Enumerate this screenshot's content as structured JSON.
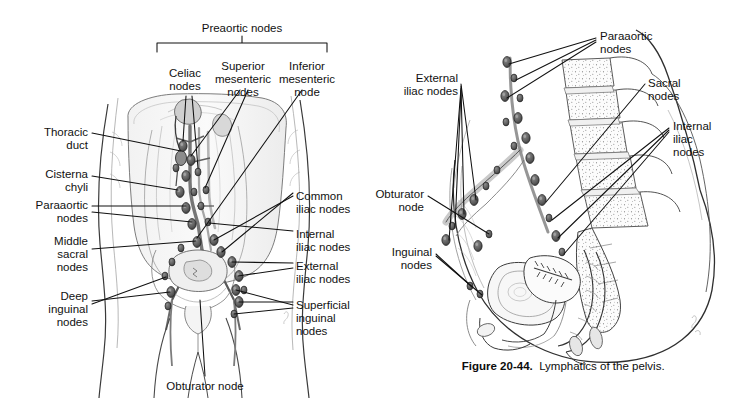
{
  "figure": {
    "caption_number": "Figure 20-44.",
    "caption_text": "Lymphatics of the pelvis.",
    "background_color": "#ffffff",
    "ink_color": "#111111"
  },
  "panel_left": {
    "name": "Anterior abdominopelvic lymphatic drainage",
    "bracket_label": "Preaortic nodes",
    "labels": [
      {
        "id": "celiac",
        "text": "Celiac\nnodes",
        "align": "center",
        "x": 185,
        "y": 67
      },
      {
        "id": "superior-mesenteric",
        "text": "Superior\nmesenteric\nnodes",
        "align": "center",
        "x": 243,
        "y": 60
      },
      {
        "id": "inferior-mesenteric",
        "text": "Inferior\nmesenteric\nnode",
        "align": "center",
        "x": 306,
        "y": 60
      },
      {
        "id": "thoracic-duct",
        "text": "Thoracic\nduct",
        "align": "right",
        "x": 88,
        "y": 126
      },
      {
        "id": "cisterna-chyli",
        "text": "Cisterna\nchyli",
        "align": "right",
        "x": 88,
        "y": 168
      },
      {
        "id": "paraaortic",
        "text": "Paraaortic\nnodes",
        "align": "right",
        "x": 88,
        "y": 199
      },
      {
        "id": "middle-sacral",
        "text": "Middle\nsacral\nnodes",
        "align": "right",
        "x": 88,
        "y": 235
      },
      {
        "id": "deep-inguinal",
        "text": "Deep\ninguinal\nnodes",
        "align": "right",
        "x": 88,
        "y": 290
      },
      {
        "id": "common-iliac",
        "text": "Common\niliac nodes",
        "align": "left",
        "x": 296,
        "y": 190
      },
      {
        "id": "internal-iliac",
        "text": "Internal\niliac nodes",
        "align": "left",
        "x": 296,
        "y": 228
      },
      {
        "id": "external-iliac",
        "text": "External\niliac nodes",
        "align": "left",
        "x": 296,
        "y": 260
      },
      {
        "id": "superficial-inguinal",
        "text": "Superficial\ninguinal\nnodes",
        "align": "left",
        "x": 296,
        "y": 299
      },
      {
        "id": "obturator",
        "text": "Obturator node",
        "align": "center",
        "x": 205,
        "y": 380
      }
    ]
  },
  "panel_right": {
    "name": "Sagittal pelvic lymphatic drainage",
    "labels": [
      {
        "id": "paraaortic",
        "text": "Paraaortic\nnodes",
        "align": "left",
        "x": 600,
        "y": 30
      },
      {
        "id": "external-iliac",
        "text": "External\niliac nodes",
        "align": "right",
        "x": 458,
        "y": 72
      },
      {
        "id": "sacral",
        "text": "Sacral\nnodes",
        "align": "left",
        "x": 648,
        "y": 77
      },
      {
        "id": "internal-iliac",
        "text": "Internal\niliac\nnodes",
        "align": "left",
        "x": 673,
        "y": 120
      },
      {
        "id": "obturator",
        "text": "Obturator\nnode",
        "align": "right",
        "x": 424,
        "y": 188
      },
      {
        "id": "inguinal",
        "text": "Inguinal\nnodes",
        "align": "right",
        "x": 432,
        "y": 246
      }
    ]
  }
}
